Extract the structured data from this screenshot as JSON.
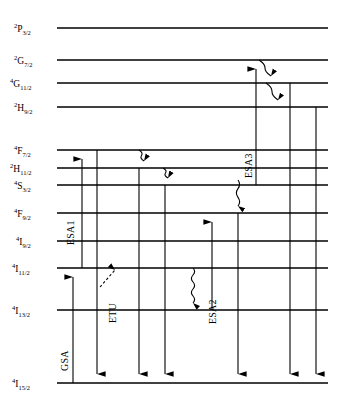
{
  "figure": {
    "type": "energy-level-diagram",
    "width": 345,
    "height": 412,
    "background": "#ffffff",
    "line_color": "#000000"
  },
  "levels": [
    {
      "id": "2P3/2",
      "multiplicity": "2",
      "term": "P",
      "j": "3/2",
      "y": 28,
      "x_start": 57,
      "x_end": 328
    },
    {
      "id": "2G7/2",
      "multiplicity": "2",
      "term": "G",
      "j": "7/2",
      "y": 60,
      "x_start": 57,
      "x_end": 328
    },
    {
      "id": "4G11/2",
      "multiplicity": "4",
      "term": "G",
      "j": "11/2",
      "y": 83,
      "x_start": 57,
      "x_end": 328
    },
    {
      "id": "2H9/2",
      "multiplicity": "2",
      "term": "H",
      "j": "9/2",
      "y": 107,
      "x_start": 57,
      "x_end": 328
    },
    {
      "id": "4F7/2",
      "multiplicity": "4",
      "term": "F",
      "j": "7/2",
      "y": 150,
      "x_start": 57,
      "x_end": 328
    },
    {
      "id": "2H11/2",
      "multiplicity": "2",
      "term": "H",
      "j": "11/2",
      "y": 168,
      "x_start": 57,
      "x_end": 328
    },
    {
      "id": "4S3/2",
      "multiplicity": "4",
      "term": "S",
      "j": "3/2",
      "y": 185,
      "x_start": 57,
      "x_end": 328
    },
    {
      "id": "4F9/2",
      "multiplicity": "4",
      "term": "F",
      "j": "9/2",
      "y": 213,
      "x_start": 57,
      "x_end": 328
    },
    {
      "id": "4I9/2",
      "multiplicity": "4",
      "term": "I",
      "j": "9/2",
      "y": 241,
      "x_start": 57,
      "x_end": 328
    },
    {
      "id": "4I11/2",
      "multiplicity": "4",
      "term": "I",
      "j": "11/2",
      "y": 268,
      "x_start": 57,
      "x_end": 328
    },
    {
      "id": "4I13/2",
      "multiplicity": "4",
      "term": "I",
      "j": "13/2",
      "y": 310,
      "x_start": 57,
      "x_end": 328
    },
    {
      "id": "4I15/2",
      "multiplicity": "4",
      "term": "I",
      "j": "15/2",
      "y": 383,
      "x_start": 57,
      "x_end": 328
    }
  ],
  "label_positions": [
    {
      "id": "2P3/2",
      "x": 14,
      "y": 23
    },
    {
      "id": "2G7/2",
      "x": 14,
      "y": 55
    },
    {
      "id": "4G11/2",
      "x": 10,
      "y": 78
    },
    {
      "id": "2H9/2",
      "x": 14,
      "y": 102
    },
    {
      "id": "4F7/2",
      "x": 14,
      "y": 145
    },
    {
      "id": "2H11/2",
      "x": 10,
      "y": 163
    },
    {
      "id": "4S3/2",
      "x": 14,
      "y": 180
    },
    {
      "id": "4F9/2",
      "x": 14,
      "y": 208
    },
    {
      "id": "4I9/2",
      "x": 16,
      "y": 236
    },
    {
      "id": "4I11/2",
      "x": 12,
      "y": 263
    },
    {
      "id": "4I13/2",
      "x": 12,
      "y": 305
    },
    {
      "id": "4I15/2",
      "x": 12,
      "y": 378
    }
  ],
  "process_labels": [
    {
      "name": "GSA",
      "text": "GSA",
      "x": 70,
      "y": 360,
      "rotation": -90
    },
    {
      "name": "ESA1",
      "text": "ESA1",
      "x": 76,
      "y": 234,
      "rotation": -90
    },
    {
      "name": "ETU",
      "text": "ETU",
      "x": 118,
      "y": 312,
      "rotation": -90
    },
    {
      "name": "ESA2",
      "text": "ESA2",
      "x": 218,
      "y": 313,
      "rotation": -90
    },
    {
      "name": "ESA3",
      "text": "ESA3",
      "x": 254,
      "y": 167,
      "rotation": -90
    }
  ],
  "transitions": {
    "excitation_arrows": [
      {
        "name": "gsa-arrow",
        "x": 73,
        "from_y": 383,
        "to_y": 268,
        "style": "solid",
        "direction": "up",
        "process": "GSA"
      },
      {
        "name": "esa1-arrow",
        "x": 82,
        "from_y": 268,
        "to_y": 150,
        "style": "solid",
        "direction": "up",
        "process": "ESA1"
      },
      {
        "name": "esa2-arrow",
        "x": 212,
        "from_y": 310,
        "to_y": 213,
        "style": "solid",
        "direction": "up",
        "process": "ESA2"
      },
      {
        "name": "esa3-arrow",
        "x": 256,
        "from_y": 185,
        "to_y": 60,
        "style": "solid",
        "direction": "up",
        "process": "ESA3"
      },
      {
        "name": "etu-arrow",
        "x": 100,
        "from_y": 287,
        "to_y": 266,
        "style": "dashed",
        "direction": "up-right",
        "process": "ETU",
        "x_end": 118
      }
    ],
    "emission_arrows": [
      {
        "name": "emission-4f7-to-ground",
        "x": 97,
        "from_y": 150,
        "to_y": 383
      },
      {
        "name": "emission-2h11-to-ground",
        "x": 139,
        "from_y": 168,
        "to_y": 383
      },
      {
        "name": "emission-4s3-to-ground",
        "x": 165,
        "from_y": 185,
        "to_y": 383
      },
      {
        "name": "emission-4f9-to-ground",
        "x": 238,
        "from_y": 213,
        "to_y": 383
      },
      {
        "name": "emission-4g11-to-ground",
        "x": 290,
        "from_y": 83,
        "to_y": 383
      },
      {
        "name": "emission-2h9-to-ground",
        "x": 316,
        "from_y": 107,
        "to_y": 383
      }
    ],
    "nonradiative_decays": [
      {
        "name": "decay-4f7-to-2h11",
        "x": 139,
        "from_y": 150,
        "to_y": 168,
        "tilt": 5
      },
      {
        "name": "decay-2h11-to-4s3",
        "x": 163,
        "from_y": 168,
        "to_y": 185,
        "tilt": 5
      },
      {
        "name": "decay-2g7-to-4g11",
        "x": 259,
        "from_y": 60,
        "to_y": 83,
        "tilt": 12
      },
      {
        "name": "decay-4g11-to-2h9",
        "x": 266,
        "from_y": 83,
        "to_y": 107,
        "tilt": 12
      },
      {
        "name": "decay-4s3-to-4f9",
        "x": 238,
        "from_y": 180,
        "to_y": 213,
        "tilt": 0
      },
      {
        "name": "decay-4i11-to-4i13",
        "x": 193,
        "from_y": 268,
        "to_y": 310,
        "tilt": 0
      }
    ]
  }
}
